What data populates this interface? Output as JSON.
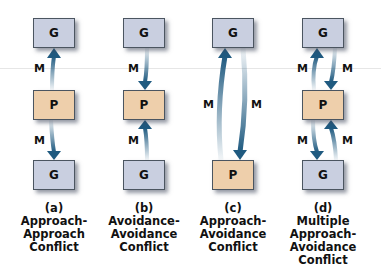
{
  "colors": {
    "goal_box": "#c9cfe0",
    "person_box": "#eecfab",
    "arrow": "#1f5a80",
    "border": "#4b5560"
  },
  "diagrams": [
    {
      "id": "a",
      "nodes": {
        "top": "G",
        "middle": "P",
        "bottom": "G"
      },
      "motives": [
        "M",
        "M"
      ],
      "caption": {
        "letter": "(a)",
        "lines": [
          "Approach-",
          "Approach",
          "Conflict"
        ]
      }
    },
    {
      "id": "b",
      "nodes": {
        "top": "G",
        "middle": "P",
        "bottom": "G"
      },
      "motives": [
        "M",
        "M"
      ],
      "caption": {
        "letter": "(b)",
        "lines": [
          "Avoidance-",
          "Avoidance",
          "Conflict"
        ]
      }
    },
    {
      "id": "c",
      "nodes": {
        "top": "G",
        "bottom": "P"
      },
      "motives": [
        "M",
        "M"
      ],
      "caption": {
        "letter": "(c)",
        "lines": [
          "Approach-",
          "Avoidance",
          "Conflict"
        ]
      }
    },
    {
      "id": "d",
      "nodes": {
        "top": "G",
        "middle": "P",
        "bottom": "G"
      },
      "motives": [
        "M",
        "M",
        "M",
        "M"
      ],
      "caption": {
        "letter": "(d)",
        "lines": [
          "Multiple",
          "Approach-",
          "Avoidance",
          "Conflict"
        ]
      }
    }
  ]
}
